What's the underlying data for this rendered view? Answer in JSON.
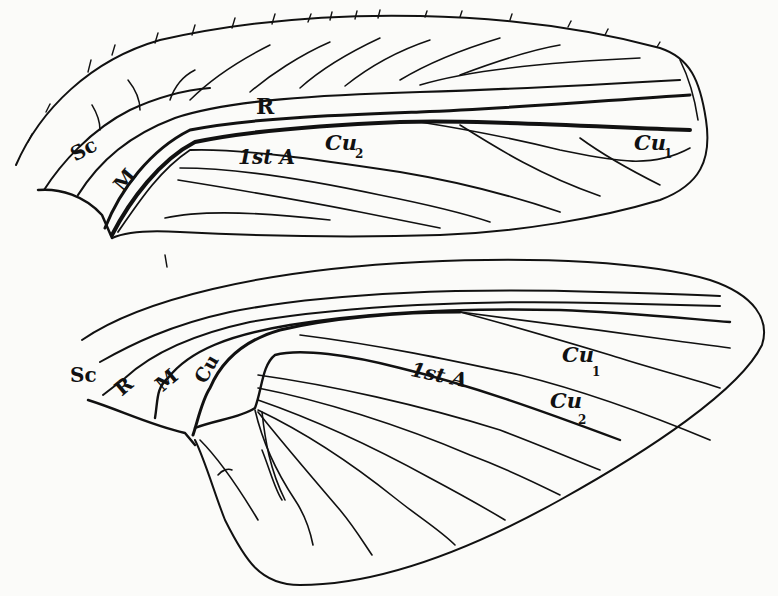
{
  "figure": {
    "forewing": {
      "labels": {
        "sc": "Sc",
        "r": "R",
        "m": "M",
        "cu2_base": "Cu",
        "cu2_sub": "2",
        "first_a": "1st A",
        "cu1_base": "Cu",
        "cu1_sub": "1"
      }
    },
    "hindwing": {
      "labels": {
        "sc": "Sc",
        "r": "R",
        "m": "M",
        "cu": "Cu",
        "cu1_base": "Cu",
        "cu1_sub": "1",
        "first_a": "1st A",
        "cu2_base": "Cu",
        "cu2_sub": "2"
      }
    }
  }
}
